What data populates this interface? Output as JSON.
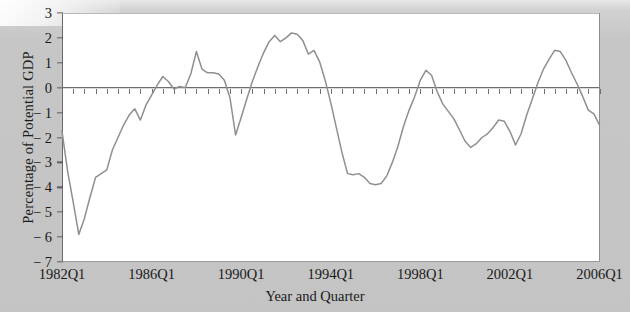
{
  "figure": {
    "background_color": "#c4c4c4",
    "plot_background_color": "#ffffff",
    "line_color": "#8f8f8f",
    "axis_color": "#5d5d5d"
  },
  "chart_data": {
    "type": "line",
    "title": "",
    "xlabel": "Year and Quarter",
    "ylabel": "Percentage of Potential GDP",
    "ylim": [
      -7,
      3
    ],
    "xlim": [
      "1982Q1",
      "2006Q1"
    ],
    "ytick_labels": [
      "3",
      "2",
      "1",
      "0",
      "− 1",
      "− 2",
      "− 3",
      "− 4",
      "− 5",
      "− 6",
      "− 7"
    ],
    "ytick_values": [
      3,
      2,
      1,
      0,
      -1,
      -2,
      -3,
      -4,
      -5,
      -6,
      -7
    ],
    "xtick_labels": [
      "1982Q1",
      "1986Q1",
      "1990Q1",
      "1994Q1",
      "1998Q1",
      "2002Q1",
      "2006Q1"
    ],
    "xtick_values": [
      "1982Q1",
      "1986Q1",
      "1990Q1",
      "1994Q1",
      "1998Q1",
      "2002Q1",
      "2006Q1"
    ],
    "grid": false,
    "legend": null,
    "zero_line": true,
    "minor_ticks_on_zero_axis": true,
    "series": [
      {
        "name": "Output gap",
        "x": [
          "1982Q1",
          "1982Q2",
          "1982Q3",
          "1982Q4",
          "1983Q1",
          "1983Q2",
          "1983Q3",
          "1983Q4",
          "1984Q1",
          "1984Q2",
          "1984Q3",
          "1984Q4",
          "1985Q1",
          "1985Q2",
          "1985Q3",
          "1985Q4",
          "1986Q1",
          "1986Q2",
          "1986Q3",
          "1986Q4",
          "1987Q1",
          "1987Q2",
          "1987Q3",
          "1987Q4",
          "1988Q1",
          "1988Q2",
          "1988Q3",
          "1988Q4",
          "1989Q1",
          "1989Q2",
          "1989Q3",
          "1989Q4",
          "1990Q1",
          "1990Q2",
          "1990Q3",
          "1990Q4",
          "1991Q1",
          "1991Q2",
          "1991Q3",
          "1991Q4",
          "1992Q1",
          "1992Q2",
          "1992Q3",
          "1992Q4",
          "1993Q1",
          "1993Q2",
          "1993Q3",
          "1993Q4",
          "1994Q1",
          "1994Q2",
          "1994Q3",
          "1994Q4",
          "1995Q1",
          "1995Q2",
          "1995Q3",
          "1995Q4",
          "1996Q1",
          "1996Q2",
          "1996Q3",
          "1996Q4",
          "1997Q1",
          "1997Q2",
          "1997Q3",
          "1997Q4",
          "1998Q1",
          "1998Q2",
          "1998Q3",
          "1998Q4",
          "1999Q1",
          "1999Q2",
          "1999Q3",
          "1999Q4",
          "2000Q1",
          "2000Q2",
          "2000Q3",
          "2000Q4",
          "2001Q1",
          "2001Q2",
          "2001Q3",
          "2001Q4",
          "2002Q1",
          "2002Q2",
          "2002Q3",
          "2002Q4",
          "2003Q1",
          "2003Q2",
          "2003Q3",
          "2003Q4",
          "2004Q1",
          "2004Q2",
          "2004Q3",
          "2004Q4",
          "2005Q1",
          "2005Q2",
          "2005Q3",
          "2005Q4",
          "2006Q1"
        ],
        "values": [
          -1.75,
          -3.35,
          -4.6,
          -5.9,
          -5.25,
          -4.4,
          -3.6,
          -3.45,
          -3.3,
          -2.5,
          -2.0,
          -1.5,
          -1.1,
          -0.85,
          -1.3,
          -0.7,
          -0.3,
          0.1,
          0.45,
          0.25,
          -0.05,
          0.05,
          0.0,
          0.55,
          1.45,
          0.75,
          0.6,
          0.6,
          0.55,
          0.3,
          -0.4,
          -1.9,
          -1.2,
          -0.45,
          0.25,
          0.85,
          1.4,
          1.85,
          2.1,
          1.85,
          2.0,
          2.2,
          2.15,
          1.9,
          1.35,
          1.5,
          1.05,
          0.3,
          -0.6,
          -1.6,
          -2.6,
          -3.45,
          -3.5,
          -3.45,
          -3.6,
          -3.85,
          -3.9,
          -3.85,
          -3.55,
          -3.0,
          -2.35,
          -1.55,
          -0.9,
          -0.35,
          0.3,
          0.7,
          0.5,
          -0.15,
          -0.65,
          -0.95,
          -1.25,
          -1.7,
          -2.15,
          -2.4,
          -2.25,
          -2.0,
          -1.85,
          -1.6,
          -1.3,
          -1.35,
          -1.75,
          -2.3,
          -1.85,
          -1.1,
          -0.45,
          0.2,
          0.75,
          1.15,
          1.5,
          1.45,
          1.1,
          0.6,
          0.15,
          -0.35,
          -0.9,
          -1.05,
          -1.5
        ]
      }
    ]
  },
  "axes": {
    "y_axis_name": "Percentage of Potential GDP",
    "x_axis_name": "Year and Quarter"
  }
}
